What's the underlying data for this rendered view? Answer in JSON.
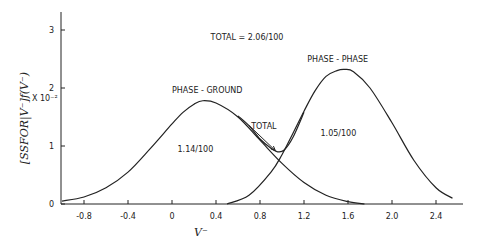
{
  "chart_data": {
    "type": "line",
    "title": "",
    "xlabel": "V⁻",
    "ylabel": "[SSFOR|V⁻]f(V⁻)",
    "y_multiplier_label": "X 10⁻²",
    "xlim": [
      -1.0,
      2.6
    ],
    "ylim": [
      0,
      3.3
    ],
    "x_ticks": [
      -0.8,
      -0.4,
      0,
      0.4,
      0.8,
      1.2,
      1.6,
      2.0,
      2.4
    ],
    "x_tick_labels": [
      "-0.8",
      "-0.4",
      "0",
      "0.4",
      "0.8",
      "1.2",
      "1.6",
      "2.0",
      "2.4"
    ],
    "y_ticks": [
      0,
      1,
      2,
      3
    ],
    "y_tick_labels": [
      "0",
      "1",
      "2",
      "3"
    ],
    "grid": false,
    "series": [
      {
        "name": "PHASE - GROUND",
        "x": [
          -1.0,
          -0.8,
          -0.6,
          -0.4,
          -0.2,
          0.0,
          0.1,
          0.2,
          0.28,
          0.4,
          0.6,
          0.8,
          1.0,
          1.2,
          1.4,
          1.6,
          1.75
        ],
        "y": [
          0.05,
          0.12,
          0.28,
          0.55,
          0.95,
          1.38,
          1.58,
          1.72,
          1.78,
          1.74,
          1.5,
          1.1,
          0.7,
          0.37,
          0.15,
          0.04,
          0.0
        ]
      },
      {
        "name": "PHASE - PHASE",
        "x": [
          0.5,
          0.7,
          0.9,
          1.0,
          1.1,
          1.2,
          1.3,
          1.4,
          1.5,
          1.57,
          1.65,
          1.8,
          2.0,
          2.2,
          2.4,
          2.55
        ],
        "y": [
          0.0,
          0.15,
          0.55,
          0.85,
          1.22,
          1.6,
          1.95,
          2.2,
          2.3,
          2.32,
          2.28,
          2.0,
          1.4,
          0.75,
          0.28,
          0.1
        ]
      },
      {
        "name": "TOTAL",
        "x": [
          0.6,
          0.7,
          0.8,
          0.9,
          0.96,
          1.02,
          1.1,
          1.2
        ],
        "y": [
          1.52,
          1.35,
          1.12,
          0.96,
          0.9,
          0.93,
          1.15,
          1.58
        ]
      }
    ],
    "annotations": [
      {
        "text": "TOTAL = 2.06/100",
        "x": 0.35,
        "y": 2.82
      },
      {
        "text": "PHASE - GROUND",
        "x": 0.0,
        "y": 1.92
      },
      {
        "text": "PHASE - PHASE",
        "x": 1.23,
        "y": 2.45
      },
      {
        "text": "1.14/100",
        "x": 0.05,
        "y": 0.9
      },
      {
        "text": "1.05/100",
        "x": 1.35,
        "y": 1.17
      },
      {
        "text": "TOTAL",
        "x": 0.72,
        "y": 1.3,
        "arrow_to": [
          0.94,
          0.92
        ]
      }
    ]
  }
}
